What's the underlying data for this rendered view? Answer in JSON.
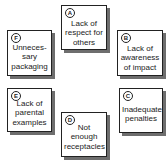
{
  "diagram": {
    "type": "cycle of labeled boxes",
    "colors": {
      "border": "#222222",
      "shadow": "#6e6e6e",
      "background": "#ffffff"
    },
    "boxes": [
      {
        "id": "A",
        "lines": [
          "Lack of",
          "respect for",
          "others"
        ]
      },
      {
        "id": "B",
        "lines": [
          "Lack of",
          "awareness",
          "of impact"
        ]
      },
      {
        "id": "C",
        "lines": [
          "Inadequate",
          "penalties"
        ]
      },
      {
        "id": "D",
        "lines": [
          "Not",
          "enough",
          "receptacles"
        ]
      },
      {
        "id": "E",
        "lines": [
          "Lack of",
          "parental",
          "examples"
        ]
      },
      {
        "id": "F",
        "lines": [
          "Unneces-",
          "sary",
          "packaging"
        ]
      }
    ]
  }
}
